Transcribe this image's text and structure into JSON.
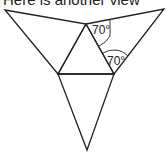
{
  "caption": "Here is another view",
  "figure": {
    "angles": [
      {
        "label": "70°",
        "position": "apex-right"
      },
      {
        "label": "70°",
        "position": "right-outer-triangle"
      }
    ]
  },
  "colors": {
    "stroke": "#222222",
    "background": "#ffffff"
  }
}
